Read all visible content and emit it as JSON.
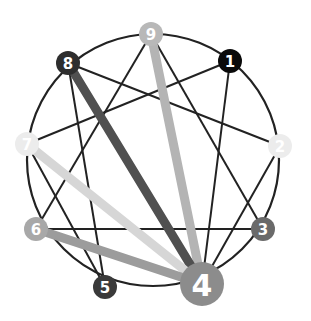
{
  "diagram": {
    "type": "enneagram",
    "circle": {
      "cx": 153,
      "cy": 160,
      "r": 126,
      "stroke": "#222222"
    },
    "nodes": [
      {
        "id": "1",
        "label": "1",
        "x": 230,
        "y": 61,
        "r": 12,
        "color": "#0a0a0a",
        "font": 15
      },
      {
        "id": "2",
        "label": "2",
        "x": 280,
        "y": 146,
        "r": 12,
        "color": "#ececec",
        "font": 15
      },
      {
        "id": "3",
        "label": "3",
        "x": 263,
        "y": 229,
        "r": 12,
        "color": "#6a6a6a",
        "font": 15
      },
      {
        "id": "4",
        "label": "4",
        "x": 202,
        "y": 284,
        "r": 22,
        "color": "#8c8c8c",
        "font": 30
      },
      {
        "id": "5",
        "label": "5",
        "x": 105,
        "y": 287,
        "r": 12,
        "color": "#3a3a3a",
        "font": 15
      },
      {
        "id": "6",
        "label": "6",
        "x": 36,
        "y": 229,
        "r": 12,
        "color": "#a8a8a8",
        "font": 15
      },
      {
        "id": "7",
        "label": "7",
        "x": 27,
        "y": 144,
        "r": 12,
        "color": "#ececec",
        "font": 15
      },
      {
        "id": "8",
        "label": "8",
        "x": 68,
        "y": 63,
        "r": 12,
        "color": "#2e2e2e",
        "font": 15
      },
      {
        "id": "9",
        "label": "9",
        "x": 151,
        "y": 34,
        "r": 12,
        "color": "#b8b8b8",
        "font": 15
      }
    ],
    "thin_lines": [
      [
        "3",
        "6"
      ],
      [
        "6",
        "9"
      ],
      [
        "9",
        "3"
      ],
      [
        "1",
        "4"
      ],
      [
        "4",
        "2"
      ],
      [
        "2",
        "8"
      ],
      [
        "8",
        "5"
      ],
      [
        "5",
        "7"
      ],
      [
        "7",
        "1"
      ]
    ],
    "thick_lines": [
      {
        "from": "4",
        "to": "9",
        "color": "#b4b4b4",
        "width": 9
      },
      {
        "from": "4",
        "to": "8",
        "color": "#505050",
        "width": 9
      },
      {
        "from": "4",
        "to": "7",
        "color": "#d6d6d6",
        "width": 9
      },
      {
        "from": "4",
        "to": "6",
        "color": "#9c9c9c",
        "width": 9
      }
    ]
  }
}
